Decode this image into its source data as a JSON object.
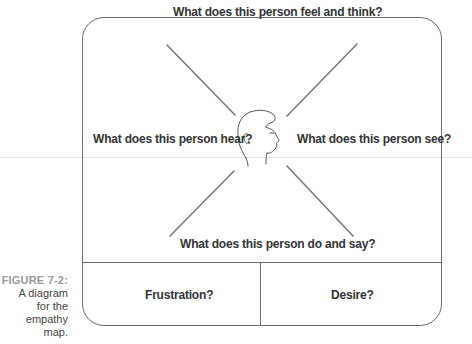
{
  "caption": {
    "figure_number": "FIGURE 7-2:",
    "lines": [
      "A diagram",
      "for the",
      "empathy map."
    ]
  },
  "diagram": {
    "title": "Empathy map",
    "center_icon": "head-profile-icon",
    "quadrants": {
      "top": "What does this person feel and think?",
      "left": "What does this person hear?",
      "right": "What does this person see?",
      "bottom": "What does this person do and say?"
    },
    "bottom_cells": {
      "left": "Frustration?",
      "right": "Desire?"
    },
    "colors": {
      "line": "#6a6a6a",
      "text": "#333333",
      "caption_number": "#999999"
    }
  }
}
